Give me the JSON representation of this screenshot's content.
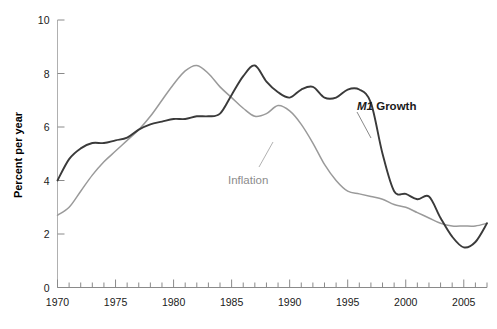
{
  "chart_data": {
    "type": "line",
    "title": "",
    "subtitle": "",
    "xlabel": "",
    "ylabel": "Percent per year",
    "xlim": [
      1970,
      2007
    ],
    "ylim": [
      0,
      10
    ],
    "grid": false,
    "legend_position": "inline-annotations",
    "y_ticks": [
      "0",
      "2",
      "4",
      "6",
      "8",
      "10"
    ],
    "y_tick_values": [
      0,
      2,
      4,
      6,
      8,
      10
    ],
    "x_ticks": [
      "1970",
      "1975",
      "1980",
      "1985",
      "1990",
      "1995",
      "2000",
      "2005"
    ],
    "x_tick_values": [
      1970,
      1975,
      1980,
      1985,
      1990,
      1995,
      2000,
      2005
    ],
    "x_minor_tick_interval": 1,
    "x": [
      1970,
      1971,
      1972,
      1973,
      1974,
      1975,
      1976,
      1977,
      1978,
      1979,
      1980,
      1981,
      1982,
      1983,
      1984,
      1985,
      1986,
      1987,
      1988,
      1989,
      1990,
      1991,
      1992,
      1993,
      1994,
      1995,
      1996,
      1997,
      1998,
      1999,
      2000,
      2001,
      2002,
      2003,
      2004,
      2005,
      2006,
      2007
    ],
    "series": [
      {
        "name": "M1 Growth",
        "color": "#3a3a3a",
        "label_text_italic": "M1",
        "label_text_rest": "Growth",
        "values": [
          4.0,
          4.8,
          5.2,
          5.4,
          5.4,
          5.5,
          5.6,
          5.9,
          6.1,
          6.2,
          6.3,
          6.3,
          6.4,
          6.4,
          6.5,
          7.2,
          7.9,
          8.3,
          7.7,
          7.3,
          7.1,
          7.4,
          7.5,
          7.1,
          7.1,
          7.4,
          7.4,
          6.9,
          5.0,
          3.6,
          3.5,
          3.3,
          3.4,
          2.6,
          1.9,
          1.5,
          1.7,
          2.4
        ]
      },
      {
        "name": "Inflation",
        "color": "#9a9a9a",
        "label_text": "Inflation",
        "values": [
          2.7,
          3.0,
          3.6,
          4.2,
          4.7,
          5.1,
          5.5,
          5.9,
          6.4,
          7.0,
          7.6,
          8.1,
          8.3,
          8.0,
          7.5,
          7.1,
          6.7,
          6.4,
          6.5,
          6.8,
          6.6,
          6.1,
          5.4,
          4.6,
          4.0,
          3.6,
          3.5,
          3.4,
          3.3,
          3.1,
          3.0,
          2.8,
          2.6,
          2.4,
          2.3,
          2.3,
          2.3,
          2.4
        ]
      }
    ],
    "annotations": [
      {
        "text": "M1 Growth",
        "x": 1998.5,
        "y": 6.9
      },
      {
        "text": "Inflation",
        "x": 1986.0,
        "y": 4.2
      }
    ]
  },
  "axis": {
    "y_title": "Percent per year"
  }
}
